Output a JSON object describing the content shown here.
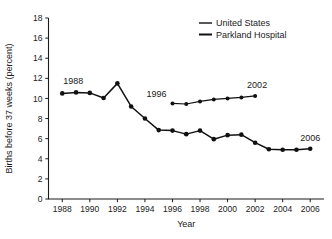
{
  "chart_data": {
    "type": "line",
    "title": "",
    "subtitle": "",
    "xlabel": "Year",
    "ylabel": "Births before 37 weeks (percent)",
    "xlim": [
      1987,
      2007
    ],
    "ylim": [
      0,
      18
    ],
    "ytick_step": 2,
    "xtick_step": 2,
    "grid": false,
    "legend_position": "top-right",
    "xticks": [
      1988,
      1990,
      1992,
      1994,
      1996,
      1998,
      2000,
      2002,
      2004,
      2006
    ],
    "yticks": [
      0,
      2,
      4,
      6,
      8,
      10,
      12,
      14,
      16,
      18
    ],
    "series": [
      {
        "name": "United States",
        "marker": "circle",
        "x": [
          1996,
          1997,
          1998,
          1999,
          2000,
          2001,
          2002
        ],
        "values": [
          9.5,
          9.45,
          9.7,
          9.9,
          10.0,
          10.1,
          10.25
        ]
      },
      {
        "name": "Parkland Hospital",
        "marker": "circle",
        "x": [
          1988,
          1989,
          1990,
          1991,
          1992,
          1993,
          1994,
          1995,
          1996,
          1997,
          1998,
          1999,
          2000,
          2001,
          2002,
          2003,
          2004,
          2005,
          2006
        ],
        "values": [
          10.5,
          10.6,
          10.55,
          10.05,
          11.5,
          9.2,
          8.0,
          6.85,
          6.8,
          6.45,
          6.8,
          5.95,
          6.35,
          6.4,
          5.6,
          4.95,
          4.9,
          4.9,
          5.0
        ]
      }
    ],
    "annotations": [
      {
        "text": "1988",
        "x": 1988,
        "y": 10.5,
        "anchor": "start"
      },
      {
        "text": "1996",
        "x": 1996,
        "y": 9.5,
        "anchor": "end"
      },
      {
        "text": "2002",
        "x": 2002,
        "y": 10.25,
        "anchor": "middle"
      },
      {
        "text": "2006",
        "x": 2006,
        "y": 5.0,
        "anchor": "middle"
      }
    ]
  },
  "legend": {
    "entries": [
      {
        "label": "United States"
      },
      {
        "label": "Parkland Hospital"
      }
    ]
  },
  "axes": {
    "y_title": "Births before 37 weeks (percent)",
    "x_title": "Year"
  },
  "colors": {
    "ink": "#111111",
    "background": "#ffffff"
  }
}
